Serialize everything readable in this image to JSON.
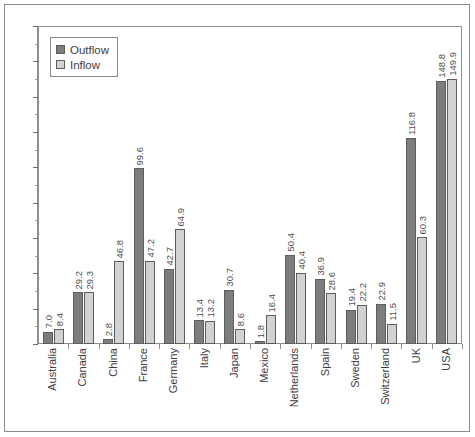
{
  "chart_data": {
    "type": "bar",
    "title": "",
    "xlabel": "",
    "ylabel": "",
    "ylim": [
      0,
      180
    ],
    "ytick_step": 20,
    "yminor_step": 10,
    "grid": false,
    "legend_position": "top-left",
    "categories": [
      "Australia",
      "Canada",
      "China",
      "France",
      "Germany",
      "Italy",
      "Japan",
      "Mexico",
      "Netherlands",
      "Spain",
      "Sweden",
      "Switzerland",
      "UK",
      "USA"
    ],
    "yticks": [
      "0",
      "20",
      "40",
      "60",
      "80",
      "100",
      "120",
      "140",
      "160",
      "180"
    ],
    "series": [
      {
        "name": "Outflow",
        "color": "#7d7d7d",
        "values": [
          7.0,
          29.2,
          2.8,
          99.6,
          42.7,
          13.4,
          30.7,
          1.8,
          50.4,
          36.9,
          19.4,
          22.9,
          116.8,
          148.8
        ],
        "labels": [
          "7.0",
          "29.2",
          "2.8",
          "99.6",
          "42.7",
          "13.4",
          "30.7",
          "1.8",
          "50.4",
          "36.9",
          "19.4",
          "22.9",
          "116.8",
          "148.8"
        ]
      },
      {
        "name": "Inflow",
        "color": "#d2d2d2",
        "values": [
          8.4,
          29.3,
          46.8,
          47.2,
          64.9,
          13.2,
          8.6,
          16.4,
          40.4,
          28.6,
          22.2,
          11.5,
          60.3,
          149.9
        ],
        "labels": [
          "8.4",
          "29.3",
          "46.8",
          "47.2",
          "64.9",
          "13.2",
          "8.6",
          "16.4",
          "40.4",
          "28.6",
          "22.2",
          "11.5",
          "60.3",
          "149.9"
        ]
      }
    ]
  },
  "legend": {
    "items": [
      {
        "label": "Outflow",
        "swatch": "outflow"
      },
      {
        "label": "Inflow",
        "swatch": "inflow"
      }
    ]
  }
}
